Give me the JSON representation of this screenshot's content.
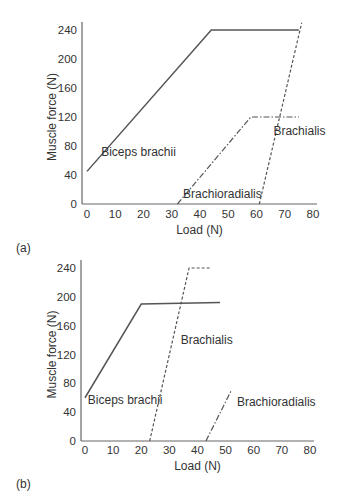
{
  "chart_data": [
    {
      "panel": "(a)",
      "type": "line",
      "xlabel": "Load (N)",
      "ylabel": "Muscle force (N)",
      "xticks": [
        0,
        10,
        20,
        30,
        40,
        50,
        60,
        70,
        80
      ],
      "yticks": [
        0,
        40,
        80,
        120,
        160,
        200,
        240
      ],
      "xlim": [
        0,
        80
      ],
      "ylim": [
        0,
        240
      ],
      "grid": false,
      "series": [
        {
          "name": "Biceps brachii",
          "style": "solid",
          "points": [
            [
              0,
              45
            ],
            [
              44,
              240
            ],
            [
              75,
              240
            ]
          ],
          "label_pos": [
            5,
            66
          ]
        },
        {
          "name": "Brachioradialis",
          "style": "dashdot",
          "points": [
            [
              32,
              0
            ],
            [
              58,
              120
            ],
            [
              75,
              120
            ]
          ],
          "label_pos": [
            34,
            8
          ]
        },
        {
          "name": "Brachialis",
          "style": "dashed",
          "points": [
            [
              61,
              0
            ],
            [
              76,
              250
            ]
          ],
          "label_pos": [
            66,
            95
          ]
        }
      ]
    },
    {
      "panel": "(b)",
      "type": "line",
      "xlabel": "Load (N)",
      "ylabel": "Muscle force (N)",
      "xticks": [
        0,
        10,
        20,
        30,
        40,
        50,
        60,
        70,
        80
      ],
      "yticks": [
        0,
        40,
        80,
        120,
        160,
        200,
        240
      ],
      "xlim": [
        0,
        80
      ],
      "ylim": [
        0,
        240
      ],
      "grid": false,
      "series": [
        {
          "name": "Biceps brachii",
          "style": "solid",
          "points": [
            [
              0,
              60
            ],
            [
              20,
              190
            ],
            [
              48,
              192
            ]
          ],
          "label_pos": [
            1,
            52
          ]
        },
        {
          "name": "Brachialis",
          "style": "dashed",
          "points": [
            [
              23,
              0
            ],
            [
              37,
              240
            ],
            [
              45,
              240
            ]
          ],
          "label_pos": [
            34,
            134
          ]
        },
        {
          "name": "Brachioradialis",
          "style": "dashdot",
          "points": [
            [
              43,
              0
            ],
            [
              52,
              70
            ]
          ],
          "label_pos": [
            54,
            48
          ]
        }
      ]
    }
  ]
}
